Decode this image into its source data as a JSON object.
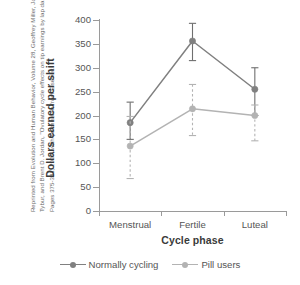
{
  "attribution": {
    "text": "Reprinted from Evolution and Human Behavior, Volume 28, Geoffrey Miller, Joshua M. Tybur, and Brent D. Jordan, \"Ovulatory cycle effects on tip earnings by lap dancers,\" Pages 375-381, 2007, with permission from Elsevier."
  },
  "colors": {
    "series_normally_cycling": "#808080",
    "series_pill_users": "#b3b3b3",
    "axis": "#9a9a9a",
    "text": "#555555",
    "title_text": "#3a3a3a",
    "background": "#ffffff"
  },
  "axis_titles": {
    "x": "Cycle phase",
    "y": "Dollars earned per shift"
  },
  "y_ticks": [
    "0",
    "50",
    "100",
    "150",
    "200",
    "250",
    "300",
    "350",
    "400"
  ],
  "x_ticks": [
    "Menstrual",
    "Fertile",
    "Luteal"
  ],
  "legend": {
    "items": [
      {
        "label": "Normally cycling",
        "key": "normally_cycling"
      },
      {
        "label": "Pill users",
        "key": "pill_users"
      }
    ]
  },
  "chart_data": {
    "type": "line",
    "title": "",
    "subtitle": "",
    "xlabel": "Cycle phase",
    "ylabel": "Dollars earned per shift",
    "categories": [
      "Menstrual",
      "Fertile",
      "Luteal"
    ],
    "ylim": [
      0,
      400
    ],
    "yticks": [
      0,
      50,
      100,
      150,
      200,
      250,
      300,
      350,
      400
    ],
    "grid": false,
    "legend_position": "bottom-center",
    "error_bars": "vertical, capped; solid for Normally cycling, dashed for Pill users",
    "series": [
      {
        "name": "Normally cycling",
        "color": "#808080",
        "line_style": "solid",
        "marker": "circle",
        "values": [
          185,
          356,
          255
        ],
        "error_low": [
          150,
          315,
          200
        ],
        "error_high": [
          228,
          393,
          300
        ]
      },
      {
        "name": "Pill users",
        "color": "#b3b3b3",
        "line_style": "solid",
        "error_bar_style": "dashed",
        "marker": "circle",
        "values": [
          136,
          214,
          200
        ],
        "error_low": [
          68,
          158,
          147
        ],
        "error_high": [
          198,
          265,
          222
        ]
      }
    ]
  }
}
